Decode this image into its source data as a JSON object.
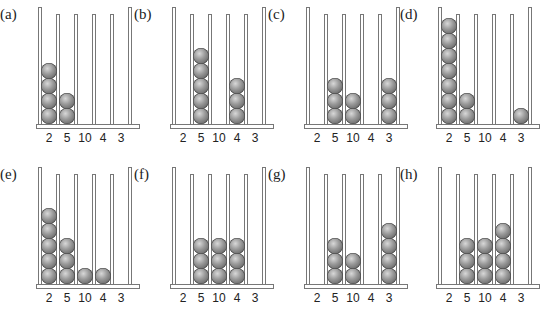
{
  "column_labels": [
    "2",
    "5",
    "10",
    "4",
    "3"
  ],
  "panels": [
    {
      "label": "(a)",
      "counts": [
        4,
        2,
        0,
        0,
        0
      ]
    },
    {
      "label": "(b)",
      "counts": [
        0,
        5,
        0,
        3,
        0
      ]
    },
    {
      "label": "(c)",
      "counts": [
        0,
        3,
        2,
        0,
        3
      ]
    },
    {
      "label": "(d)",
      "counts": [
        7,
        2,
        0,
        0,
        1
      ]
    },
    {
      "label": "(e)",
      "counts": [
        5,
        3,
        1,
        1,
        0
      ]
    },
    {
      "label": "(f)",
      "counts": [
        0,
        3,
        3,
        3,
        0
      ]
    },
    {
      "label": "(g)",
      "counts": [
        0,
        3,
        2,
        0,
        4
      ]
    },
    {
      "label": "(h)",
      "counts": [
        0,
        3,
        3,
        4,
        0
      ]
    }
  ]
}
